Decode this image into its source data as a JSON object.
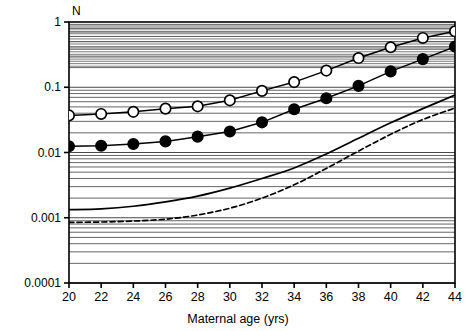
{
  "chart_data": {
    "type": "line",
    "title": "",
    "ylabel": "N",
    "xlabel": "Maternal age (yrs)",
    "xlim": [
      20,
      44
    ],
    "ylim": [
      0.0001,
      1
    ],
    "yscale": "log",
    "grid": "horizontal-minor-log",
    "legend": "none",
    "xticks": [
      20,
      22,
      24,
      26,
      28,
      30,
      32,
      34,
      36,
      38,
      40,
      42,
      44
    ],
    "xtick_labels": [
      "20",
      "22",
      "24",
      "26",
      "28",
      "30",
      "32",
      "34",
      "36",
      "38",
      "40",
      "42",
      "44"
    ],
    "yticks": [
      1,
      0.1,
      0.01,
      0.001,
      0.0001
    ],
    "ytick_labels": [
      "1",
      "0.1",
      "0.01",
      "0.001",
      "0.0001"
    ],
    "x": [
      20,
      22,
      24,
      26,
      28,
      30,
      32,
      34,
      36,
      38,
      40,
      42,
      44
    ],
    "series": [
      {
        "name": "open-circle-series",
        "marker": "open-circle",
        "line": "solid",
        "color": "#000000",
        "fill": "#ffffff",
        "values": [
          0.037,
          0.039,
          0.042,
          0.047,
          0.051,
          0.063,
          0.088,
          0.12,
          0.18,
          0.28,
          0.41,
          0.57,
          0.72
        ]
      },
      {
        "name": "filled-circle-series",
        "marker": "filled-circle",
        "line": "solid",
        "color": "#000000",
        "fill": "#000000",
        "values": [
          0.0125,
          0.0127,
          0.0135,
          0.0148,
          0.0175,
          0.021,
          0.029,
          0.046,
          0.068,
          0.105,
          0.175,
          0.27,
          0.42
        ]
      },
      {
        "name": "solid-curve-no-marker",
        "marker": "none",
        "line": "solid",
        "color": "#000000",
        "values": [
          0.00133,
          0.00137,
          0.0015,
          0.00175,
          0.00215,
          0.00285,
          0.004,
          0.0058,
          0.0095,
          0.0165,
          0.0285,
          0.047,
          0.076
        ]
      },
      {
        "name": "dashed-curve-no-marker",
        "marker": "none",
        "line": "dashed",
        "color": "#000000",
        "values": [
          0.00085,
          0.00086,
          0.00089,
          0.00095,
          0.0011,
          0.0014,
          0.002,
          0.0032,
          0.0057,
          0.0105,
          0.019,
          0.032,
          0.048
        ]
      }
    ]
  },
  "axes": {
    "y_axis_title": "N",
    "x_axis_title": "Maternal age (yrs)"
  }
}
